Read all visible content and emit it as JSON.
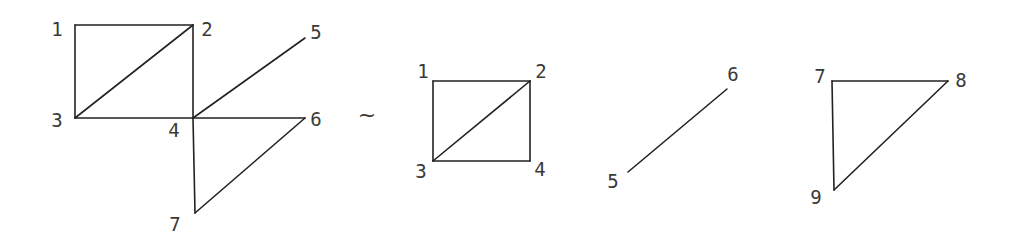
{
  "diagram": {
    "relation_symbol": "~",
    "relation_pos": [
      367,
      116
    ],
    "graphs": [
      {
        "name": "original-graph",
        "nodes": [
          {
            "id": "1",
            "x": 75,
            "y": 25,
            "lx": 57,
            "ly": 30
          },
          {
            "id": "2",
            "x": 193,
            "y": 25,
            "lx": 207,
            "ly": 30
          },
          {
            "id": "3",
            "x": 75,
            "y": 118,
            "lx": 57,
            "ly": 121
          },
          {
            "id": "4",
            "x": 193,
            "y": 118,
            "lx": 174,
            "ly": 131
          },
          {
            "id": "5",
            "x": 305,
            "y": 38,
            "lx": 316,
            "ly": 33
          },
          {
            "id": "6",
            "x": 305,
            "y": 118,
            "lx": 316,
            "ly": 120
          },
          {
            "id": "7",
            "x": 195,
            "y": 213,
            "lx": 175,
            "ly": 225
          }
        ],
        "edges": [
          [
            "1",
            "2"
          ],
          [
            "1",
            "3"
          ],
          [
            "2",
            "3"
          ],
          [
            "2",
            "4"
          ],
          [
            "3",
            "4"
          ],
          [
            "4",
            "5"
          ],
          [
            "4",
            "6"
          ],
          [
            "4",
            "7"
          ],
          [
            "6",
            "7"
          ]
        ]
      },
      {
        "name": "block-square",
        "nodes": [
          {
            "id": "1",
            "x": 433,
            "y": 81,
            "lx": 423,
            "ly": 72
          },
          {
            "id": "2",
            "x": 530,
            "y": 81,
            "lx": 541,
            "ly": 72
          },
          {
            "id": "3",
            "x": 433,
            "y": 161,
            "lx": 421,
            "ly": 172
          },
          {
            "id": "4",
            "x": 530,
            "y": 161,
            "lx": 540,
            "ly": 170
          }
        ],
        "edges": [
          [
            "1",
            "2"
          ],
          [
            "1",
            "3"
          ],
          [
            "2",
            "3"
          ],
          [
            "2",
            "4"
          ],
          [
            "3",
            "4"
          ]
        ]
      },
      {
        "name": "block-segment",
        "nodes": [
          {
            "id": "5",
            "x": 628,
            "y": 172,
            "lx": 613,
            "ly": 182
          },
          {
            "id": "6",
            "x": 727,
            "y": 89,
            "lx": 733,
            "ly": 75
          }
        ],
        "edges": [
          [
            "5",
            "6"
          ]
        ]
      },
      {
        "name": "block-triangle",
        "nodes": [
          {
            "id": "7",
            "x": 832,
            "y": 81,
            "lx": 820,
            "ly": 77
          },
          {
            "id": "8",
            "x": 948,
            "y": 81,
            "lx": 961,
            "ly": 81
          },
          {
            "id": "9",
            "x": 834,
            "y": 190,
            "lx": 816,
            "ly": 198
          }
        ],
        "edges": [
          [
            "7",
            "8"
          ],
          [
            "7",
            "9"
          ],
          [
            "8",
            "9"
          ]
        ]
      }
    ]
  }
}
